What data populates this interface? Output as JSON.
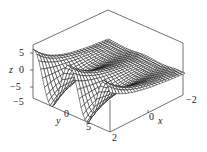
{
  "chart_data": {
    "type": "surface3d",
    "title": "",
    "xlabel": "x",
    "ylabel": "y",
    "zlabel": "z",
    "x_ticks": [
      "2",
      "0",
      "−2"
    ],
    "y_ticks": [
      "−5",
      "0",
      "5"
    ],
    "z_ticks": [
      "5",
      "0",
      "−5"
    ],
    "xlim": [
      -2,
      2
    ],
    "ylim": [
      -8,
      8
    ],
    "zlim": [
      -8,
      8
    ],
    "style": "wireframe mesh, black lines on white, boxed axes"
  },
  "colors": {
    "mesh": "#111111",
    "box": "#333333",
    "background": "#ffffff"
  }
}
